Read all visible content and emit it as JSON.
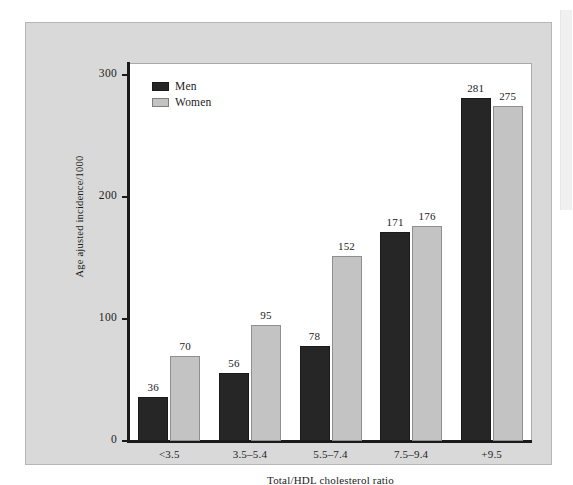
{
  "chart_data": {
    "type": "bar",
    "title": "",
    "xlabel": "Total/HDL cholesterol ratio",
    "ylabel": "Age ajusted incidence/1000",
    "categories": [
      "<3.5",
      "3.5–5.4",
      "5.5–7.4",
      "7.5–9.4",
      "+9.5"
    ],
    "series": [
      {
        "name": "Men",
        "color": "#262626",
        "values": [
          36,
          56,
          78,
          171,
          281
        ]
      },
      {
        "name": "Women",
        "color": "#c3c3c3",
        "values": [
          70,
          95,
          152,
          176,
          275
        ]
      }
    ],
    "ylim": [
      0,
      310
    ],
    "yticks": [
      0,
      100,
      200,
      300
    ],
    "ytick_labels": [
      "0",
      "100",
      "200",
      "300"
    ],
    "grid": false,
    "legend_position": "top-left",
    "value_labels": true
  },
  "figure": {
    "panel_background": "#d9d9d9",
    "plot_background": "#ffffff",
    "axis_color": "#1a1a1a"
  },
  "legend": {
    "items": [
      {
        "label": "Men",
        "swatch": "men"
      },
      {
        "label": "Women",
        "swatch": "women"
      }
    ]
  }
}
